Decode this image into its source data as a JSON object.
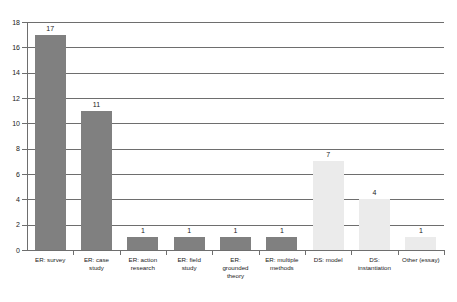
{
  "chart_data": {
    "type": "bar",
    "title": "",
    "subtitle": "",
    "xlabel": "",
    "ylabel": "",
    "ylim": [
      0,
      18
    ],
    "ytick_step": 2,
    "yticks": [
      0,
      2,
      4,
      6,
      8,
      10,
      12,
      14,
      16,
      18
    ],
    "ytick_labels": [
      "0",
      "2",
      "4",
      "6",
      "8",
      "10",
      "12",
      "14",
      "16",
      "18"
    ],
    "grid": true,
    "grid_axis": "y",
    "legend": false,
    "legend_position": "none",
    "categories": [
      "ER: survey",
      "ER: case study",
      "ER: action research",
      "ER: field study",
      "ER: grounded theory",
      "ER: multiple methods",
      "DS: model",
      "DS: instantiation",
      "Other (essay)"
    ],
    "category_label_lines": [
      [
        "ER: survey"
      ],
      [
        "ER: case",
        "study"
      ],
      [
        "ER: action",
        "research"
      ],
      [
        "ER: field",
        "study"
      ],
      [
        "ER:",
        "grounded",
        "theory"
      ],
      [
        "ER: multiple",
        "methods"
      ],
      [
        "DS: model"
      ],
      [
        "DS:",
        "instantiation"
      ],
      [
        "Other (essay)"
      ]
    ],
    "values": [
      17,
      11,
      1,
      1,
      1,
      1,
      7,
      4,
      1
    ],
    "value_labels": [
      "17",
      "11",
      "1",
      "1",
      "1",
      "1",
      "7",
      "4",
      "1"
    ],
    "bar_colors": [
      "#808080",
      "#808080",
      "#808080",
      "#808080",
      "#808080",
      "#808080",
      "#ebebeb",
      "#ebebeb",
      "#ebebeb"
    ],
    "bar_color_groups": [
      "dark",
      "dark",
      "dark",
      "dark",
      "dark",
      "dark",
      "light",
      "light",
      "light"
    ],
    "show_value_labels": true
  },
  "style": {
    "background": "#ffffff",
    "axis_color": "#6e6e6e",
    "grid_color": "#6e6e6e",
    "text_color": "#1a1a1a",
    "dark_bar": "#808080",
    "light_bar": "#ebebeb"
  }
}
